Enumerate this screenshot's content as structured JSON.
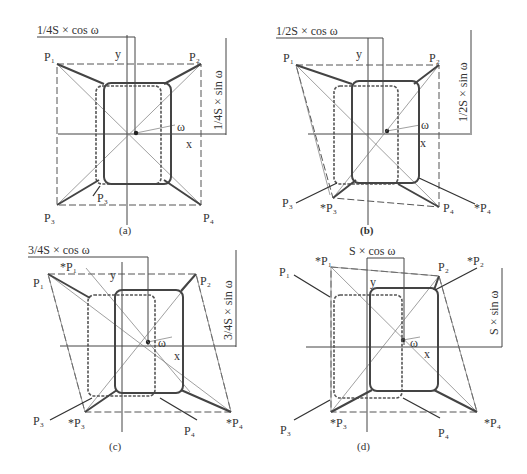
{
  "panels": [
    {
      "id": "a",
      "caption": "(a)",
      "dim_horizontal": "1/4S × cos ω",
      "dim_vertical": "1/4S × sin ω",
      "axis_x": "x",
      "axis_y": "y",
      "angle": "ω",
      "points": [
        "P₁",
        "P₂",
        "P₃",
        "P₄"
      ],
      "moved_points": [
        "P₃"
      ],
      "moved_prefix": ""
    },
    {
      "id": "b",
      "caption": "(b)",
      "dim_horizontal": "1/2S × cos ω",
      "dim_vertical": "1/2S × sin ω",
      "axis_x": "x",
      "axis_y": "y",
      "angle": "ω",
      "points": [
        "P₁",
        "P₂",
        "P₃",
        "P₄"
      ],
      "moved_points": [
        "*P₃",
        "*P₄"
      ]
    },
    {
      "id": "c",
      "caption": "(c)",
      "dim_horizontal": "3/4S × cos ω",
      "dim_vertical": "3/4S × sin ω",
      "axis_x": "x",
      "axis_y": "y",
      "angle": "ω",
      "points": [
        "P₁",
        "P₂",
        "P₃",
        "P₄"
      ],
      "moved_points": [
        "*P₁",
        "*P₃",
        "*P₄"
      ]
    },
    {
      "id": "d",
      "caption": "(d)",
      "dim_horizontal": "S × cos ω",
      "dim_vertical": "S × sin ω",
      "axis_x": "x",
      "axis_y": "y",
      "angle": "ω",
      "points": [
        "P₁",
        "P₂",
        "P₃",
        "P₄"
      ],
      "moved_points": [
        "*P₁",
        "*P₂",
        "*P₃",
        "*P₄"
      ]
    }
  ]
}
